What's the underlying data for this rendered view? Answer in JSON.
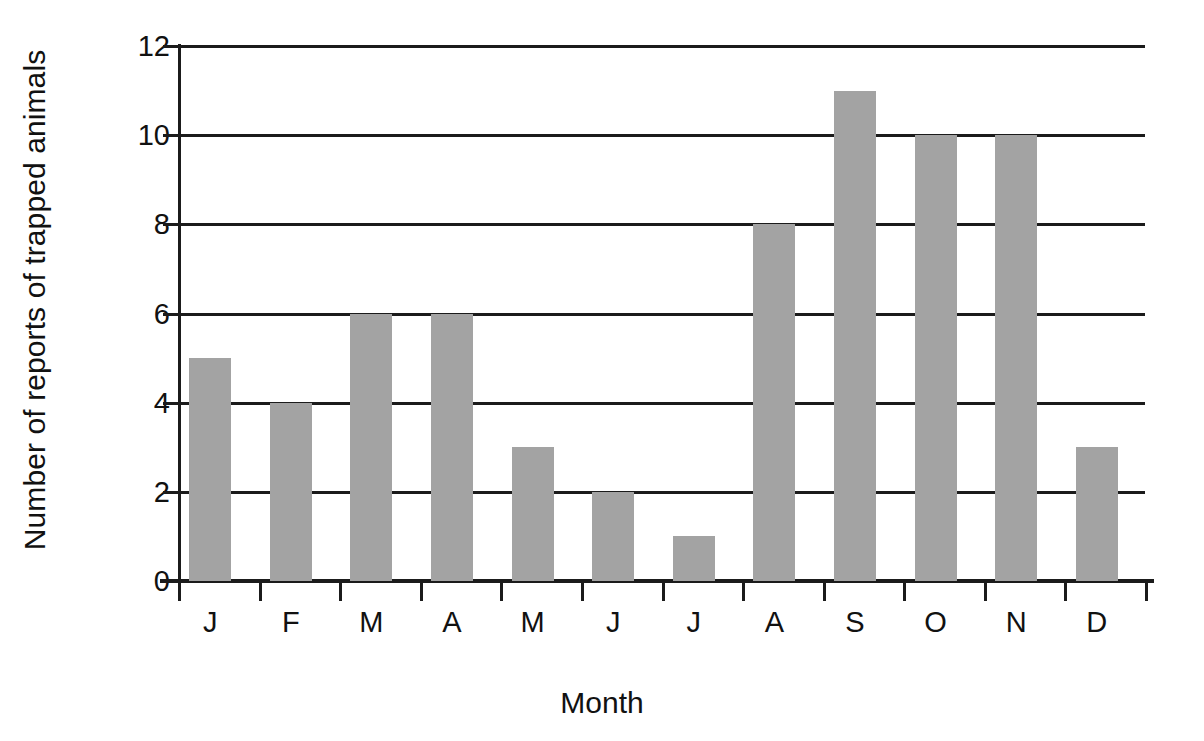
{
  "chart_data": {
    "type": "bar",
    "title": "",
    "xlabel": "Month",
    "ylabel": "Number of reports of trapped animals",
    "categories": [
      "J",
      "F",
      "M",
      "A",
      "M",
      "J",
      "J",
      "A",
      "S",
      "O",
      "N",
      "D"
    ],
    "values": [
      5,
      4,
      6,
      6,
      3,
      2,
      1,
      8,
      11,
      10,
      10,
      3
    ],
    "ylim": [
      0,
      12
    ],
    "yticks": [
      0,
      2,
      4,
      6,
      8,
      10,
      12
    ],
    "ytick_labels": [
      "0",
      "2",
      "4",
      "6",
      "8",
      "10",
      "12"
    ],
    "grid": "horizontal",
    "legend": "none",
    "bar_color": "#a3a3a3",
    "axis_color": "#1b1b1b",
    "background_color": "#ffffff"
  }
}
